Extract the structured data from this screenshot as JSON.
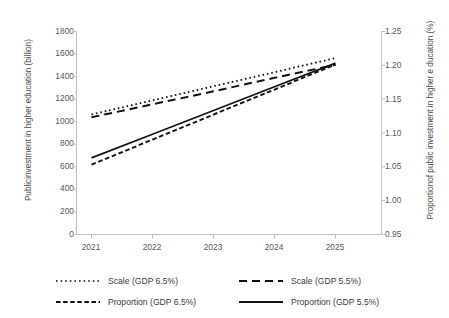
{
  "chart_data": {
    "type": "line",
    "title": "",
    "x": [
      2021,
      2022,
      2023,
      2024,
      2025
    ],
    "categories": [
      "2021",
      "2022",
      "2023",
      "2024",
      "2025"
    ],
    "xlabel": "",
    "ylabel": "Publicinvestment in higher education (billion)",
    "y2label": "Proportionof public investment in higher e ducation (%)",
    "ylim": [
      0,
      1800
    ],
    "y2lim": [
      0.95,
      1.25
    ],
    "yticks": [
      0,
      200,
      400,
      600,
      800,
      1000,
      1200,
      1400,
      1600,
      1800
    ],
    "ytick_labels": [
      "0",
      "200",
      "400",
      "600",
      "800",
      "1000",
      "1200",
      "1400",
      "1600",
      "1800"
    ],
    "y2ticks": [
      0.95,
      1.0,
      1.05,
      1.1,
      1.15,
      1.2,
      1.25
    ],
    "y2tick_labels": [
      "0.95",
      "1.00",
      "1.05",
      "1.10",
      "1.15",
      "1.20",
      "1.25"
    ],
    "grid": false,
    "legend_position": "bottom",
    "series": [
      {
        "name": "Scale (GDP 6.5%)",
        "axis": "left",
        "style": "dotted",
        "color": "#111111",
        "values": [
          1060,
          1185,
          1310,
          1435,
          1560
        ]
      },
      {
        "name": "Scale  (GDP 5.5%)",
        "axis": "left",
        "style": "dashed-long",
        "color": "#111111",
        "values": [
          1035,
          1150,
          1265,
          1385,
          1500
        ]
      },
      {
        "name": "Proportion (GDP 6.5%)",
        "axis": "right",
        "style": "dashed-short",
        "color": "#111111",
        "values": [
          1.0525,
          1.0895,
          1.1265,
          1.1635,
          1.2005
        ],
        "values_plotted_left_scale": [
          555,
          775,
          995,
          1215,
          1440
        ]
      },
      {
        "name": "Proportion (GDP 5.5%)",
        "axis": "right",
        "style": "solid",
        "color": "#111111",
        "values": [
          1.0625,
          1.0975,
          1.1325,
          1.1675,
          1.2025
        ],
        "values_plotted_left_scale": [
          615,
          825,
          1035,
          1250,
          1462
        ]
      }
    ]
  },
  "axes": {
    "left_title": "Publicinvestment in higher education (billion)",
    "right_title": "Proportionof public investment in higher e ducation (%)",
    "left_ticks": [
      "1800",
      "1600",
      "1400",
      "1200",
      "1000",
      "800",
      "600",
      "400",
      "200",
      "0"
    ],
    "right_ticks": [
      "1.25",
      "1.20",
      "1.15",
      "1.10",
      "1.05",
      "1.00",
      "0.95"
    ],
    "x_ticks": [
      "2021",
      "2022",
      "2023",
      "2024",
      "2025"
    ]
  },
  "legend": {
    "items": [
      {
        "label": "Scale (GDP 6.5%)",
        "style": "dotted"
      },
      {
        "label": "Scale  (GDP 5.5%)",
        "style": "dashed-long"
      },
      {
        "label": "Proportion (GDP 6.5%)",
        "style": "dashed-short"
      },
      {
        "label": "Proportion (GDP 5.5%)",
        "style": "solid"
      }
    ]
  }
}
